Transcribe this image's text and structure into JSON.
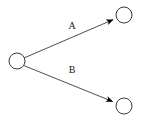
{
  "diagram": {
    "type": "directed-graph",
    "title": "",
    "canvas": {
      "width": 142,
      "height": 121,
      "background": "#ffffff"
    },
    "style": {
      "node_stroke": "#3a3a3a",
      "node_fill": "#ffffff",
      "node_stroke_width": 1,
      "edge_stroke": "#3a3a3a",
      "edge_stroke_width": 0.9,
      "arrowhead_fill": "#000000",
      "label_color": "#1a1a1a",
      "label_font_size": 10
    },
    "nodes": [
      {
        "id": "n1",
        "role": "source",
        "label": "",
        "cx": 17,
        "cy": 61,
        "r": 8
      },
      {
        "id": "n2",
        "role": "target",
        "label": "",
        "cx": 124,
        "cy": 15,
        "r": 8
      },
      {
        "id": "n3",
        "role": "target",
        "label": "",
        "cx": 124,
        "cy": 106,
        "r": 8
      }
    ],
    "edges": [
      {
        "id": "e1",
        "label": "A",
        "from": "n1",
        "to": "n2",
        "directed": true,
        "x1": 24.4,
        "y1": 57.8,
        "x2": 113.0,
        "y2": 19.7,
        "label_x": 72,
        "label_y": 29
      },
      {
        "id": "e2",
        "label": "B",
        "from": "n1",
        "to": "n3",
        "directed": true,
        "x1": 23.7,
        "y1": 65.5,
        "x2": 112.6,
        "y2": 101.5,
        "label_x": 72,
        "label_y": 73
      }
    ]
  }
}
